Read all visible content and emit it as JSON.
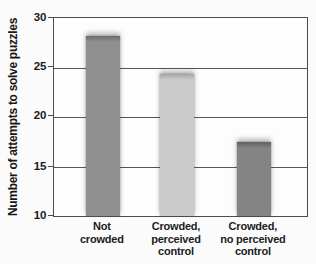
{
  "chart_data": {
    "type": "bar",
    "title": "",
    "xlabel": "",
    "ylabel": "Number of attempts to solve puzzles",
    "categories": [
      "Not\ncrowded",
      "Crowded,\nperceived\ncontrol",
      "Crowded,\nno perceived\ncontrol"
    ],
    "values": [
      28.2,
      24.3,
      17.5
    ],
    "ylim": [
      10,
      30
    ],
    "y_ticks": [
      30,
      25,
      20,
      15,
      10
    ],
    "grid": true,
    "legend": "none",
    "bar_colors": [
      "#8f8f8f",
      "#cbcbcb",
      "#848484"
    ],
    "bar_cap_colors": [
      "#6c6c6c",
      "#a6a6a6",
      "#5e5e5e"
    ],
    "axis_color": "#4d4d4d"
  }
}
